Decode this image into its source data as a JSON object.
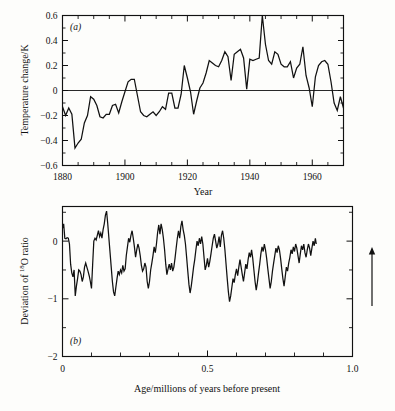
{
  "figure": {
    "background_color": "#fdfdfb",
    "ink_color": "#111111",
    "arrow_annotation": {
      "name": "up-arrow",
      "direction": "up",
      "x": 372,
      "y_top": 247,
      "y_bottom": 306
    }
  },
  "panel_a": {
    "label": "(a)",
    "ylabel": "Temperature change/K",
    "xlabel": "Year",
    "ytick_labels": [
      "0.6",
      "0.4",
      "0.2",
      "0",
      "-0.2",
      "-0.4",
      "-0.6"
    ],
    "xtick_labels": [
      "1880",
      "1900",
      "1920",
      "1940",
      "1960"
    ]
  },
  "panel_b": {
    "label": "(b)",
    "ylabel_prefix": "Deviation of ",
    "ylabel_sup": "18",
    "ylabel_suffix": "O ratio",
    "xlabel": "Age/millions of years before present",
    "ytick_labels": [
      "-2",
      "-1",
      "0"
    ],
    "xtick_labels": [
      "0",
      "0.5",
      "1.0"
    ]
  },
  "chart_data": [
    {
      "type": "line",
      "id": "panel-a",
      "title": "(a)",
      "xlabel": "Year",
      "ylabel": "Temperature change/K",
      "xlim": [
        1880,
        1970
      ],
      "ylim": [
        -0.6,
        0.6
      ],
      "yticks": [
        -0.6,
        -0.4,
        -0.2,
        0,
        0.2,
        0.4,
        0.6
      ],
      "xticks": [
        1880,
        1900,
        1920,
        1940,
        1960
      ],
      "xtick_minor_step": 5,
      "ytick_minor_step": 0.1,
      "grid": false,
      "legend": null,
      "zero_reference_line": 0,
      "x": [
        1880,
        1881,
        1882,
        1883,
        1884,
        1885,
        1886,
        1887,
        1888,
        1889,
        1890,
        1891,
        1892,
        1893,
        1894,
        1895,
        1896,
        1897,
        1898,
        1899,
        1900,
        1901,
        1902,
        1903,
        1904,
        1905,
        1906,
        1907,
        1908,
        1909,
        1910,
        1911,
        1912,
        1913,
        1914,
        1915,
        1916,
        1917,
        1918,
        1919,
        1920,
        1921,
        1922,
        1923,
        1924,
        1925,
        1926,
        1927,
        1928,
        1929,
        1930,
        1931,
        1932,
        1933,
        1934,
        1935,
        1936,
        1937,
        1938,
        1939,
        1940,
        1941,
        1942,
        1943,
        1944,
        1945,
        1946,
        1947,
        1948,
        1949,
        1950,
        1951,
        1952,
        1953,
        1954,
        1955,
        1956,
        1957,
        1958,
        1959,
        1960,
        1961,
        1962,
        1963,
        1964,
        1965,
        1966,
        1967,
        1968,
        1969,
        1970
      ],
      "values": [
        -0.13,
        -0.2,
        -0.14,
        -0.19,
        -0.46,
        -0.42,
        -0.39,
        -0.26,
        -0.2,
        -0.05,
        -0.07,
        -0.12,
        -0.21,
        -0.22,
        -0.19,
        -0.19,
        -0.12,
        -0.11,
        -0.18,
        -0.09,
        -0.01,
        0.07,
        0.09,
        0.09,
        -0.04,
        -0.17,
        -0.2,
        -0.21,
        -0.19,
        -0.17,
        -0.2,
        -0.17,
        -0.13,
        -0.15,
        -0.02,
        -0.02,
        -0.14,
        -0.14,
        -0.03,
        0.2,
        0.1,
        -0.01,
        -0.19,
        -0.08,
        0.02,
        0.06,
        0.14,
        0.24,
        0.22,
        0.2,
        0.19,
        0.24,
        0.31,
        0.27,
        0.08,
        0.29,
        0.31,
        0.33,
        0.26,
        0.01,
        0.25,
        0.24,
        0.25,
        0.26,
        0.6,
        0.37,
        0.24,
        0.21,
        0.31,
        0.29,
        0.21,
        0.19,
        0.19,
        0.23,
        0.1,
        0.18,
        0.21,
        0.35,
        0.12,
        0.02,
        -0.13,
        0.11,
        0.2,
        0.23,
        0.24,
        0.21,
        0.07,
        -0.1,
        -0.16,
        -0.05,
        -0.14
      ]
    },
    {
      "type": "line",
      "id": "panel-b",
      "title": "(b)",
      "xlabel": "Age/millions of years before present",
      "ylabel": "Deviation of 18O ratio",
      "xlim": [
        0,
        1.0
      ],
      "ylim": [
        0,
        -2.6
      ],
      "yticks": [
        0,
        -0.5,
        -1,
        -1.5,
        -2,
        -2.5
      ],
      "ytick_major": [
        0,
        -1,
        -2
      ],
      "xticks": [
        0,
        0.1,
        0.2,
        0.3,
        0.4,
        0.5,
        0.6,
        0.7,
        0.8,
        0.9,
        1.0
      ],
      "xtick_major": [
        0,
        0.5,
        1.0
      ],
      "grid": false,
      "legend": null,
      "data_extent_x": [
        0,
        0.875
      ],
      "x": [
        0.0,
        0.004,
        0.008,
        0.012,
        0.016,
        0.02,
        0.024,
        0.028,
        0.032,
        0.036,
        0.04,
        0.044,
        0.048,
        0.052,
        0.056,
        0.06,
        0.064,
        0.068,
        0.072,
        0.076,
        0.08,
        0.084,
        0.088,
        0.092,
        0.096,
        0.1,
        0.104,
        0.108,
        0.112,
        0.116,
        0.12,
        0.124,
        0.128,
        0.132,
        0.136,
        0.14,
        0.144,
        0.148,
        0.152,
        0.156,
        0.16,
        0.164,
        0.168,
        0.172,
        0.176,
        0.18,
        0.184,
        0.188,
        0.192,
        0.196,
        0.2,
        0.204,
        0.208,
        0.212,
        0.216,
        0.22,
        0.224,
        0.228,
        0.232,
        0.236,
        0.24,
        0.244,
        0.248,
        0.252,
        0.256,
        0.26,
        0.264,
        0.268,
        0.272,
        0.276,
        0.28,
        0.284,
        0.288,
        0.292,
        0.296,
        0.3,
        0.304,
        0.308,
        0.312,
        0.316,
        0.32,
        0.324,
        0.328,
        0.332,
        0.336,
        0.34,
        0.344,
        0.348,
        0.352,
        0.356,
        0.36,
        0.364,
        0.368,
        0.372,
        0.376,
        0.38,
        0.384,
        0.388,
        0.392,
        0.396,
        0.4,
        0.404,
        0.408,
        0.412,
        0.416,
        0.42,
        0.424,
        0.428,
        0.432,
        0.436,
        0.44,
        0.444,
        0.448,
        0.452,
        0.456,
        0.46,
        0.464,
        0.468,
        0.472,
        0.476,
        0.48,
        0.484,
        0.488,
        0.492,
        0.496,
        0.5,
        0.504,
        0.508,
        0.512,
        0.516,
        0.52,
        0.524,
        0.528,
        0.532,
        0.536,
        0.54,
        0.544,
        0.548,
        0.552,
        0.556,
        0.56,
        0.564,
        0.568,
        0.572,
        0.576,
        0.58,
        0.584,
        0.588,
        0.592,
        0.596,
        0.6,
        0.604,
        0.608,
        0.612,
        0.616,
        0.62,
        0.624,
        0.628,
        0.632,
        0.636,
        0.64,
        0.644,
        0.648,
        0.652,
        0.656,
        0.66,
        0.664,
        0.668,
        0.672,
        0.676,
        0.68,
        0.684,
        0.688,
        0.692,
        0.696,
        0.7,
        0.704,
        0.708,
        0.712,
        0.716,
        0.72,
        0.724,
        0.728,
        0.732,
        0.736,
        0.74,
        0.744,
        0.748,
        0.752,
        0.756,
        0.76,
        0.764,
        0.768,
        0.772,
        0.776,
        0.78,
        0.784,
        0.788,
        0.792,
        0.796,
        0.8,
        0.804,
        0.808,
        0.812,
        0.816,
        0.82,
        0.824,
        0.828,
        0.832,
        0.836,
        0.84,
        0.844,
        0.848,
        0.852,
        0.856,
        0.86,
        0.864,
        0.868,
        0.872,
        0.875
      ],
      "values": [
        -2.22,
        -2.3,
        -2.05,
        -2.04,
        -2.06,
        -2.05,
        -1.95,
        -1.6,
        -1.45,
        -1.38,
        -1.5,
        -1.05,
        -1.22,
        -1.35,
        -1.5,
        -1.48,
        -1.42,
        -1.3,
        -1.38,
        -1.55,
        -1.62,
        -1.55,
        -1.48,
        -1.4,
        -1.3,
        -1.18,
        -1.6,
        -2.0,
        -2.05,
        -2.02,
        -2.1,
        -2.18,
        -2.08,
        -2.14,
        -2.05,
        -2.2,
        -2.3,
        -2.45,
        -2.52,
        -2.3,
        -2.05,
        -1.8,
        -1.55,
        -1.3,
        -1.12,
        -1.05,
        -1.2,
        -1.35,
        -1.48,
        -1.42,
        -1.5,
        -1.45,
        -1.58,
        -1.48,
        -1.52,
        -1.75,
        -1.9,
        -2.05,
        -1.98,
        -2.1,
        -2.18,
        -2.05,
        -1.9,
        -1.72,
        -1.85,
        -1.95,
        -1.88,
        -1.75,
        -1.58,
        -1.48,
        -1.52,
        -1.62,
        -1.55,
        -1.3,
        -1.18,
        -1.3,
        -1.5,
        -1.62,
        -1.75,
        -1.9,
        -1.8,
        -1.95,
        -2.15,
        -2.28,
        -2.12,
        -2.3,
        -2.2,
        -2.05,
        -1.85,
        -1.6,
        -1.42,
        -1.52,
        -1.6,
        -1.5,
        -1.62,
        -1.48,
        -1.55,
        -1.7,
        -1.88,
        -2.05,
        -2.18,
        -2.05,
        -2.25,
        -2.35,
        -2.2,
        -2.1,
        -1.95,
        -1.72,
        -1.48,
        -1.25,
        -1.1,
        -1.22,
        -1.38,
        -1.55,
        -1.68,
        -1.85,
        -2.0,
        -1.92,
        -2.05,
        -1.95,
        -2.08,
        -1.95,
        -1.72,
        -1.5,
        -1.58,
        -1.7,
        -1.55,
        -1.65,
        -1.78,
        -1.92,
        -2.05,
        -2.12,
        -2.0,
        -1.88,
        -1.95,
        -2.08,
        -1.9,
        -2.1,
        -2.18,
        -2.05,
        -1.85,
        -1.6,
        -1.35,
        -1.12,
        -0.95,
        -1.05,
        -1.2,
        -1.35,
        -1.28,
        -1.42,
        -1.52,
        -1.4,
        -1.55,
        -1.68,
        -1.55,
        -1.42,
        -1.3,
        -1.45,
        -1.6,
        -1.52,
        -1.68,
        -1.8,
        -1.72,
        -1.85,
        -1.7,
        -1.5,
        -1.3,
        -1.15,
        -1.28,
        -1.45,
        -1.6,
        -1.78,
        -1.9,
        -1.82,
        -1.95,
        -1.85,
        -1.7,
        -1.52,
        -1.35,
        -1.18,
        -1.3,
        -1.48,
        -1.62,
        -1.75,
        -1.88,
        -1.8,
        -1.92,
        -1.85,
        -1.7,
        -1.52,
        -1.35,
        -1.22,
        -1.38,
        -1.55,
        -1.48,
        -1.62,
        -1.72,
        -1.85,
        -1.78,
        -1.9,
        -1.82,
        -1.95,
        -1.88,
        -1.75,
        -1.62,
        -1.78,
        -1.92,
        -1.85,
        -1.95,
        -1.8,
        -1.72,
        -1.85,
        -1.95,
        -1.88,
        -1.75,
        -1.88,
        -2.0,
        -1.92,
        -2.05,
        -1.95
      ]
    }
  ]
}
